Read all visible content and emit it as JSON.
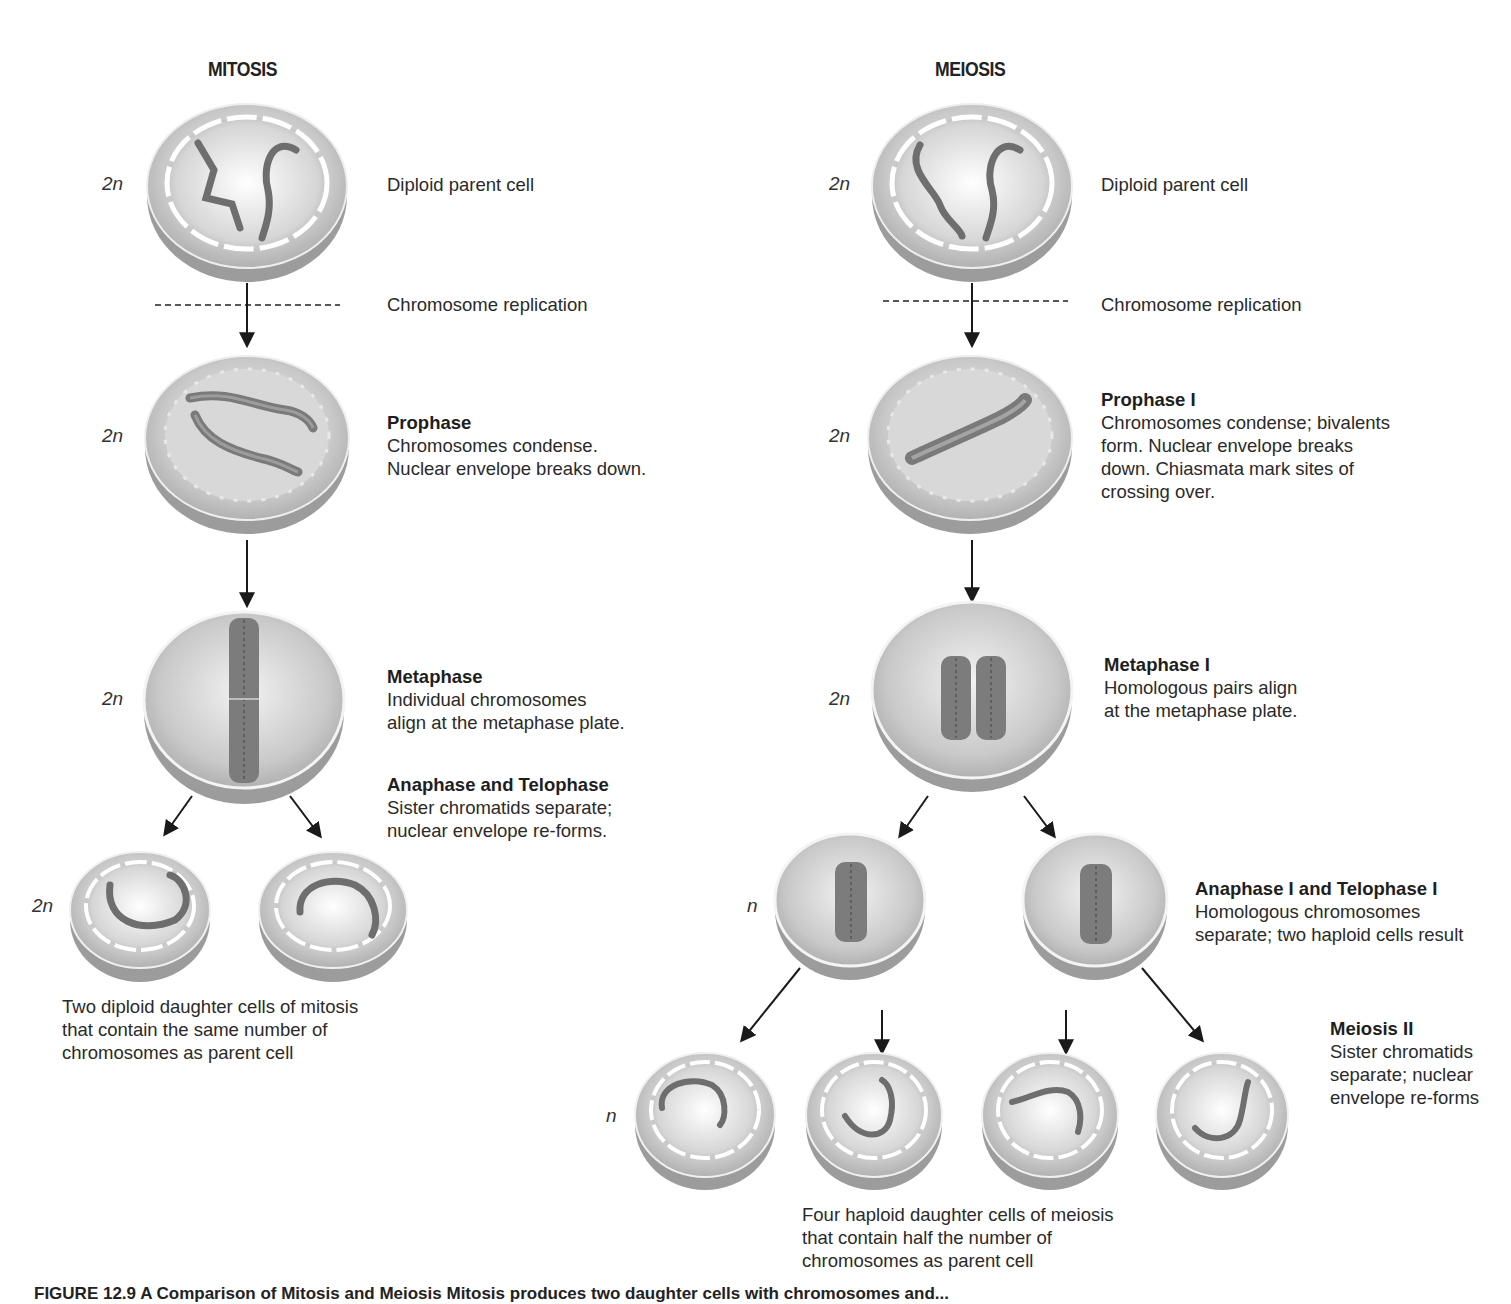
{
  "columns": {
    "mitosis": {
      "title": "MITOSIS",
      "stages": [
        {
          "ploidy": "2n",
          "head": "",
          "body": "Diploid parent cell"
        },
        {
          "ploidy": "",
          "head": "",
          "body": "Chromosome replication"
        },
        {
          "ploidy": "2n",
          "head": "Prophase",
          "body": "Chromosomes condense.\nNuclear envelope breaks down."
        },
        {
          "ploidy": "2n",
          "head": "Metaphase",
          "body": "Individual chromosomes\nalign at the metaphase plate."
        },
        {
          "ploidy": "",
          "head": "Anaphase and Telophase",
          "body": "Sister chromatids separate;\nnuclear envelope re-forms."
        },
        {
          "ploidy": "2n",
          "head": "",
          "body": ""
        }
      ],
      "result_caption": "Two diploid daughter cells of mitosis\nthat contain the same number of\nchromosomes as parent cell"
    },
    "meiosis": {
      "title": "MEIOSIS",
      "stages": [
        {
          "ploidy": "2n",
          "head": "",
          "body": "Diploid parent cell"
        },
        {
          "ploidy": "",
          "head": "",
          "body": "Chromosome replication"
        },
        {
          "ploidy": "2n",
          "head": "Prophase I",
          "body": "Chromosomes condense; bivalents\nform. Nuclear envelope breaks\ndown. Chiasmata mark sites of\ncrossing over."
        },
        {
          "ploidy": "2n",
          "head": "Metaphase I",
          "body": "Homologous pairs align\nat the metaphase plate."
        },
        {
          "ploidy": "n",
          "head": "Anaphase I and Telophase I",
          "body": "Homologous chromosomes\nseparate; two haploid cells result"
        },
        {
          "ploidy": "n",
          "head": "Meiosis II",
          "body": "Sister chromatids\nseparate; nuclear\nenvelope re-forms"
        }
      ],
      "result_caption": "Four haploid daughter cells of meiosis\nthat contain half the number of\nchromosomes as parent cell"
    }
  },
  "figure_caption": "FIGURE 12.9  A Comparison of Mitosis and Meiosis  Mitosis produces two daughter cells with chromosomes and..."
}
